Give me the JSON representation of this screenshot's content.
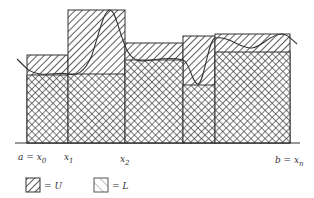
{
  "figure": {
    "title": "",
    "colors": {
      "ink": "#333333",
      "background": "#ffffff"
    }
  },
  "axis": {
    "labels": [
      {
        "id": "x0",
        "text": "a = x",
        "sub": "0"
      },
      {
        "id": "x1",
        "text": "x",
        "sub": "1"
      },
      {
        "id": "x2",
        "text": "x",
        "sub": "2"
      },
      {
        "id": "xn",
        "text": "b = x",
        "sub": "n"
      }
    ]
  },
  "legend": {
    "items": [
      {
        "pattern": "single-hatch",
        "label": "= U"
      },
      {
        "pattern": "cross-hatch",
        "label": "= L"
      }
    ]
  },
  "bars": [
    {
      "from": "x0",
      "to": "x1",
      "upper_top": 55,
      "lower_top": 75
    },
    {
      "from": "x1",
      "to": "x2",
      "upper_top": 10,
      "lower_top": 74
    },
    {
      "from": "x2",
      "to": "x3",
      "upper_top": 43,
      "lower_top": 85
    },
    {
      "from": "x3",
      "to": "x4",
      "upper_top": 36,
      "lower_top": 85
    },
    {
      "from": "x4",
      "to": "xn",
      "upper_top": 34,
      "lower_top": 52
    }
  ]
}
